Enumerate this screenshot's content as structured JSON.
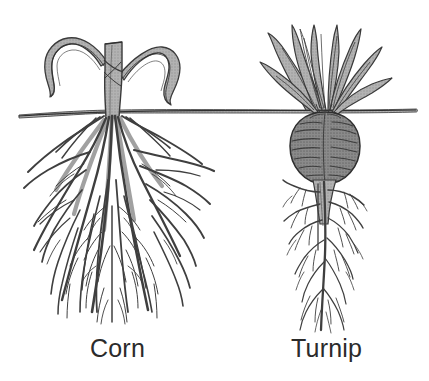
{
  "figure": {
    "background_color": "#ffffff",
    "width": 429,
    "height": 381
  },
  "colors": {
    "outline": "#3a3a3a",
    "outline_dark": "#2b2b2b",
    "stalk_fill": "#a8a8a8",
    "leaf_fill": "#b4b4b4",
    "bulb_fill": "#808080",
    "bulb_texture": "#3d3d3d",
    "ground_fill": "#8a8a8a",
    "root_stroke": "#3f3f3f",
    "caption_color": "#2b2b2b"
  },
  "ground_line": {
    "name": "soil-surface-line",
    "y": 112,
    "x_start": 18,
    "x_end": 417
  },
  "plants": [
    {
      "id": "corn",
      "label": "Corn",
      "root_type": "fibrous",
      "center_x": 113,
      "soil_y": 112,
      "stalk": {
        "top_y": 42,
        "bottom_y": 118,
        "width": 15
      },
      "leaves": [
        {
          "side": "left",
          "tip_x": 42,
          "tip_y": 88
        },
        {
          "side": "right",
          "tip_x": 178,
          "tip_y": 92
        }
      ],
      "root_extent": {
        "left_x": 20,
        "right_x": 214,
        "bottom_y": 333
      }
    },
    {
      "id": "turnip",
      "label": "Turnip",
      "root_type": "taproot",
      "center_x": 325,
      "soil_y": 112,
      "bulb": {
        "center_x": 325,
        "center_y": 148,
        "radius_x": 35,
        "radius_y": 36
      },
      "leaves_count": 9,
      "leaf_top_y": 28,
      "taproot": {
        "top_y": 183,
        "bottom_y": 330
      },
      "root_extent": {
        "left_x": 283,
        "right_x": 372,
        "bottom_y": 330
      }
    }
  ],
  "captions": {
    "corn": "Corn",
    "turnip": "Turnip"
  }
}
